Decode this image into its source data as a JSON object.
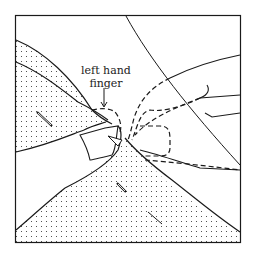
{
  "diagram": {
    "annotation": {
      "line1": "left hand",
      "line2": "finger"
    },
    "colors": {
      "line": "#1a1a1a",
      "background": "#ffffff",
      "stipple": "#333333"
    }
  }
}
